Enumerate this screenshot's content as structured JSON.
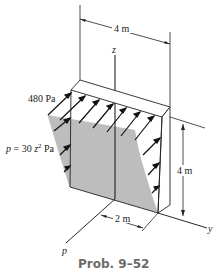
{
  "figure": {
    "caption": "Prob. 9–52",
    "labels": {
      "top_dim": "4 m",
      "height_dim": "4 m",
      "bottom_dim": "2 m",
      "max_pressure": "480 Pa",
      "pressure_eq_prefix": "p = 30 z",
      "pressure_eq_exp": "2",
      "pressure_eq_unit": " Pa",
      "axis_z": "z",
      "axis_y": "y",
      "axis_p": "p"
    },
    "colors": {
      "shade": "#bdbdbd",
      "line": "#1a1a1a",
      "caption": "#6b6b6b"
    }
  }
}
